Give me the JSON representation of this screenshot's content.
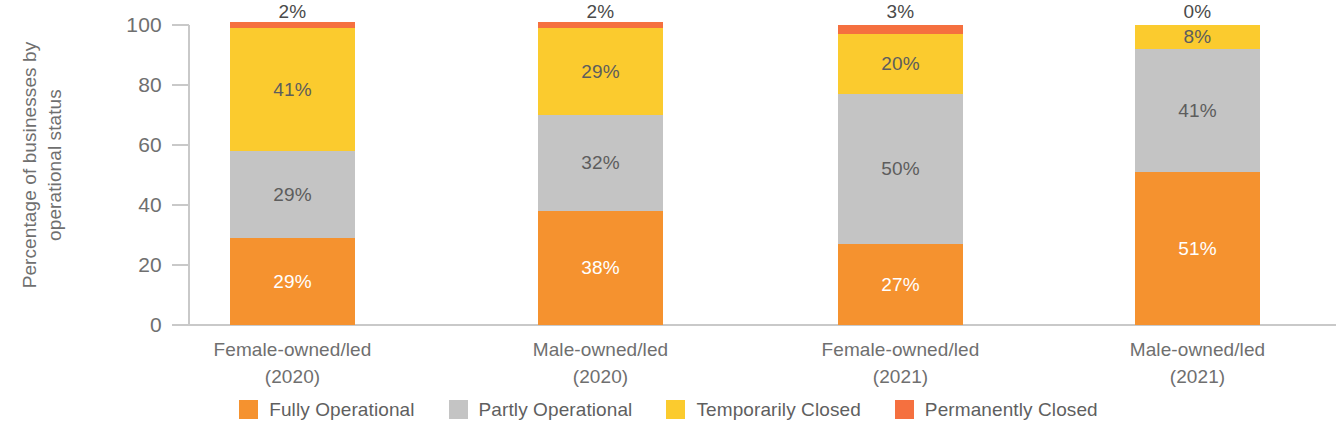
{
  "chart_data": {
    "type": "bar",
    "subtype": "stacked-column-100",
    "title": "",
    "xlabel": "",
    "ylabel": "Percentage of businesses by operational status",
    "ylabel_lines": [
      "Percentage of businesses by",
      "operational status"
    ],
    "ylim": [
      0,
      100
    ],
    "yticks": [
      0,
      20,
      40,
      60,
      80,
      100
    ],
    "ytick_labels": [
      "0",
      "20",
      "40",
      "60",
      "80",
      "100"
    ],
    "grid": false,
    "legend_position": "bottom",
    "categories": [
      "Female-owned/led (2020)",
      "Male-owned/led (2020)",
      "Female-owned/led (2021)",
      "Male-owned/led (2021)"
    ],
    "category_lines": [
      {
        "l1": "Female-owned/led",
        "l2": "(2020)"
      },
      {
        "l1": "Male-owned/led",
        "l2": "(2020)"
      },
      {
        "l1": "Female-owned/led",
        "l2": "(2021)"
      },
      {
        "l1": "Male-owned/led",
        "l2": "(2021)"
      }
    ],
    "series": [
      {
        "name": "Fully Operational",
        "color": "#F5922F",
        "values": [
          29,
          38,
          27,
          51
        ],
        "labels": [
          "29%",
          "38%",
          "27%",
          "51%"
        ]
      },
      {
        "name": "Partly Operational",
        "color": "#C4C4C4",
        "values": [
          29,
          32,
          50,
          41
        ],
        "labels": [
          "29%",
          "32%",
          "50%",
          "41%"
        ]
      },
      {
        "name": "Temporarily Closed",
        "color": "#FBCB2E",
        "values": [
          41,
          29,
          20,
          8
        ],
        "labels": [
          "41%",
          "29%",
          "20%",
          "8%"
        ]
      },
      {
        "name": "Permanently Closed",
        "color": "#F5703F",
        "values": [
          2,
          2,
          3,
          0
        ],
        "labels": [
          "2%",
          "2%",
          "3%",
          "0%"
        ]
      }
    ]
  },
  "axis": {
    "ticks": [
      {
        "label": "100"
      },
      {
        "label": "80"
      },
      {
        "label": "60"
      },
      {
        "label": "40"
      },
      {
        "label": "20"
      },
      {
        "label": "0"
      }
    ]
  },
  "legend": {
    "items": [
      {
        "label": "Fully Operational",
        "color": "#F5922F"
      },
      {
        "label": "Partly Operational",
        "color": "#C4C4C4"
      },
      {
        "label": "Temporarily Closed",
        "color": "#FBCB2E"
      },
      {
        "label": "Permanently Closed",
        "color": "#F5703F"
      }
    ]
  },
  "colors": {
    "fully_operational": "#F5922F",
    "partly_operational": "#C4C4C4",
    "temporarily_closed": "#FBCB2E",
    "permanently_closed": "#F5703F",
    "axis": "#c9c9c9",
    "text": "#6f6f6f",
    "background": "#ffffff"
  }
}
